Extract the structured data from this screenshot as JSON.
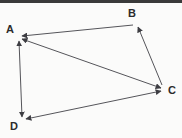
{
  "figure": {
    "kind": "directed-graph-diagram",
    "background_color": "#fbfbfa",
    "border_color": "#3a3a3a",
    "edge_color": "#55555a",
    "label_color": "#2b2b2b"
  },
  "nodes": [
    {
      "id": "A",
      "label": "A",
      "label_x": 6,
      "label_y": 24,
      "x": 18,
      "y": 37
    },
    {
      "id": "B",
      "label": "B",
      "label_x": 128,
      "label_y": 8,
      "x": 137,
      "y": 23
    },
    {
      "id": "C",
      "label": "C",
      "label_x": 168,
      "label_y": 85,
      "x": 165,
      "y": 89
    },
    {
      "id": "D",
      "label": "D",
      "label_x": 10,
      "label_y": 121,
      "x": 22,
      "y": 121
    }
  ],
  "edges": [
    {
      "id": "edge-b-a",
      "from": "B",
      "to": "A",
      "direction": "one-way",
      "x1": 133,
      "y1": 25,
      "x2": 22,
      "y2": 36
    },
    {
      "id": "edge-c-b",
      "from": "C",
      "to": "B",
      "direction": "one-way",
      "x1": 162,
      "y1": 85,
      "x2": 138,
      "y2": 27
    },
    {
      "id": "edge-a-c",
      "from": "A",
      "to": "C",
      "direction": "bidirectional",
      "x1": 22,
      "y1": 39,
      "x2": 161,
      "y2": 88
    },
    {
      "id": "edge-a-d",
      "from": "A",
      "to": "D",
      "direction": "bidirectional",
      "x1": 19,
      "y1": 41,
      "x2": 22,
      "y2": 117
    },
    {
      "id": "edge-d-c",
      "from": "D",
      "to": "C",
      "direction": "bidirectional",
      "x1": 26,
      "y1": 119,
      "x2": 161,
      "y2": 91
    }
  ]
}
